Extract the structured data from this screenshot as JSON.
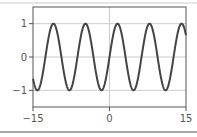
{
  "chart_data": {
    "type": "line",
    "title": "",
    "xlabel": "",
    "ylabel": "",
    "xlim": [
      -15,
      15
    ],
    "ylim": [
      -1.5,
      1.5
    ],
    "grid": true,
    "xticks": [
      -15,
      0,
      15
    ],
    "xtick_labels": [
      "−15",
      "0",
      "15"
    ],
    "yticks": [
      1,
      0,
      -1
    ],
    "ytick_labels": [
      "1",
      "0",
      "−1"
    ],
    "series": [
      {
        "name": "sin(x)",
        "function": "sin(x)",
        "color": "#444444",
        "x_range": [
          -15,
          15
        ]
      }
    ],
    "colors": {
      "frame": "#555555",
      "grid": "#cccccc",
      "separator": "#888888"
    }
  }
}
